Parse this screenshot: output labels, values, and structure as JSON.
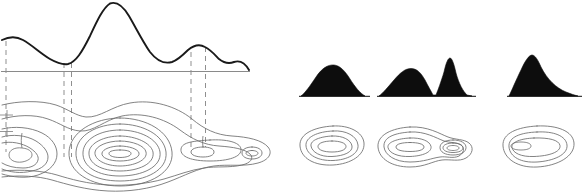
{
  "figure": {
    "background_color": "#ffffff",
    "width": 585,
    "height": 194
  },
  "colors": {
    "profile_stroke": "#1a1a1a",
    "contour_stroke": "#6d6d6d",
    "dashed_stroke": "#8f8f8f",
    "datum_stroke": "#8a8a8a",
    "hill_fill": "#0d0d0d"
  },
  "left_panel": {
    "name": "profile-and-contour-panel",
    "profile": {
      "name": "terrain-profile-curve",
      "datum_line_y": 71,
      "peaks": [
        {
          "label": "minor-left-summit",
          "x": 20,
          "y": 40
        },
        {
          "label": "main-summit",
          "x": 110,
          "y": 3
        },
        {
          "label": "minor-right-summit",
          "x": 203,
          "y": 46
        }
      ],
      "saddles": [
        {
          "label": "left-saddle",
          "x": 67,
          "y": 63
        },
        {
          "label": "right-saddle",
          "x": 185,
          "y": 58
        }
      ]
    },
    "projectors": {
      "name": "projection-dashed-lines",
      "x_positions": [
        6,
        64,
        71,
        191,
        205
      ],
      "style": "dashed"
    },
    "contour_map": {
      "name": "contour-map-left",
      "features": [
        {
          "label": "left-hill-contours",
          "center_x": 40,
          "center_y": 155,
          "rings": 5
        },
        {
          "label": "central-hill-contours",
          "center_x": 118,
          "center_y": 155,
          "rings": 8
        },
        {
          "label": "right-knoll-contours",
          "center_x": 210,
          "center_y": 152,
          "rings": 3
        },
        {
          "label": "far-right-nub-contours",
          "center_x": 247,
          "center_y": 154,
          "rings": 2
        }
      ],
      "edge_ticks": [
        {
          "label": "tick-upper",
          "x": 4,
          "y": 115
        },
        {
          "label": "tick-lower",
          "x": 4,
          "y": 132
        }
      ]
    }
  },
  "right_panel": {
    "name": "silhouette-and-contour-examples",
    "examples": [
      {
        "name": "example-single-dome",
        "silhouette": {
          "name": "dome-silhouette",
          "summits": 1,
          "shape": "broad-symmetric-dome",
          "baseline_y": 96,
          "left_x": 301,
          "right_x": 365,
          "peak_x": 333,
          "peak_y": 65
        },
        "contours": {
          "name": "dome-contours",
          "center_x": 333,
          "center_y": 148,
          "rings": 4,
          "nested": "concentric-oval"
        }
      },
      {
        "name": "example-twin-peaks",
        "silhouette": {
          "name": "twin-peak-silhouette",
          "summits": 2,
          "shape": "rounded-peak-plus-sharp-peak",
          "baseline_y": 96,
          "left_x": 379,
          "right_x": 472,
          "peak_x": 409,
          "peak_y": 68,
          "second_peak_x": 448,
          "second_peak_y": 58
        },
        "contours": {
          "name": "twin-peak-contours",
          "center_x": 412,
          "center_y": 148,
          "rings": 4,
          "secondary_center_x": 452,
          "secondary_rings": 4,
          "nested": "two-lobed-figure-eight"
        }
      },
      {
        "name": "example-asymmetric-ridge",
        "silhouette": {
          "name": "asymmetric-ridge-silhouette",
          "summits": 1,
          "shape": "steep-left-gentle-right-slope",
          "baseline_y": 96,
          "left_x": 509,
          "right_x": 578,
          "peak_x": 528,
          "peak_y": 55
        },
        "contours": {
          "name": "asymmetric-ridge-contours",
          "center_x": 532,
          "center_y": 147,
          "rings": 4,
          "nested": "offset-eccentric-oval"
        }
      }
    ]
  }
}
